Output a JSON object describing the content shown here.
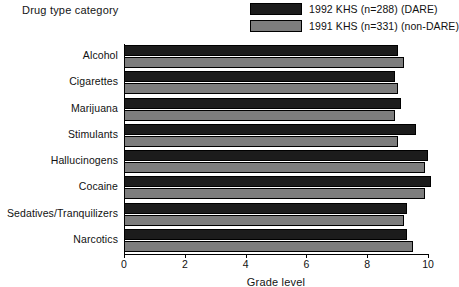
{
  "chart_data": {
    "type": "bar",
    "orientation": "horizontal",
    "title": "",
    "ylabel": "Drug type category",
    "xlabel": "Grade level",
    "xlim": [
      0,
      10
    ],
    "xticks": [
      0,
      2,
      4,
      6,
      8,
      10
    ],
    "grid": false,
    "legend_position": "top-right",
    "categories": [
      "Alcohol",
      "Cigarettes",
      "Marijuana",
      "Stimulants",
      "Hallucinogens",
      "Cocaine",
      "Sedatives/Tranquilizers",
      "Narcotics"
    ],
    "series": [
      {
        "name": "1992 KHS (n=288) (DARE)",
        "color": "#1c1c1c",
        "values": [
          9.0,
          8.9,
          9.1,
          9.6,
          10.0,
          10.1,
          9.3,
          9.3
        ]
      },
      {
        "name": "1991 KHS (n=331) (non-DARE)",
        "color": "#7d7d7d",
        "values": [
          9.2,
          9.0,
          8.9,
          9.0,
          9.9,
          9.9,
          9.2,
          9.5
        ]
      }
    ]
  },
  "colors": {
    "series_dark": "#1c1c1c",
    "series_light": "#7d7d7d",
    "axis": "#000000",
    "text": "#111111",
    "background": "#ffffff"
  }
}
